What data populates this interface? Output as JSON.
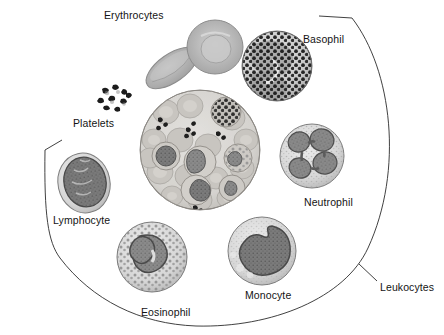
{
  "figure": {
    "background_color": "#ffffff",
    "line_color": "#2b2b2b",
    "style": "grayscale histology illustration"
  },
  "labels": [
    {
      "id": "erythrocytes",
      "text": "Erythrocytes",
      "x": 104,
      "y": 9
    },
    {
      "id": "basophil",
      "text": "Basophil",
      "x": 303,
      "y": 33
    },
    {
      "id": "platelets",
      "text": "Platelets",
      "x": 73,
      "y": 117
    },
    {
      "id": "neutrophil",
      "text": "Neutrophil",
      "x": 304,
      "y": 196
    },
    {
      "id": "lymphocyte",
      "text": "Lymphocyte",
      "x": 53,
      "y": 214
    },
    {
      "id": "eosinophil",
      "text": "Eosinophil",
      "x": 141,
      "y": 306
    },
    {
      "id": "monocyte",
      "text": "Monocyte",
      "x": 245,
      "y": 289
    },
    {
      "id": "leukocytes",
      "text": "Leukocytes",
      "x": 380,
      "y": 281
    }
  ],
  "cells": [
    {
      "id": "erythrocyte-face",
      "name": "Erythrocytes",
      "kind": "erythrocyte",
      "view": "face-on",
      "cx": 215,
      "cy": 47,
      "rx": 28,
      "ry": 27,
      "cytoplasm": "#b9b9b9",
      "nucleus": "none",
      "description": "Biconcave disc seen face-on with pale central pallor"
    },
    {
      "id": "erythrocyte-edge",
      "name": "Erythrocytes",
      "kind": "erythrocyte",
      "view": "edge-on",
      "cx": 172,
      "cy": 68,
      "rx": 30,
      "ry": 14,
      "rotate": -35,
      "cytoplasm": "#b4b4b4",
      "nucleus": "none",
      "description": "Biconcave disc seen edge-on, elongated oval"
    },
    {
      "id": "platelets",
      "name": "Platelets",
      "kind": "platelet-cluster",
      "cx": 113,
      "cy": 97,
      "rx": 17,
      "ry": 15,
      "cytoplasm": "#f2f2f2",
      "granule_color": "#202020",
      "count": 9,
      "description": "Small irregular dark cell fragments in a loose cluster"
    },
    {
      "id": "basophil",
      "name": "Basophil",
      "kind": "granulocyte",
      "cx": 277,
      "cy": 66,
      "rx": 36,
      "ry": 35,
      "cytoplasm": "#cfcfcf",
      "nucleus": "#9a9a9a",
      "granule_color": "#141414",
      "granule_density": "very high",
      "nucleus_lobes": 2,
      "description": "Round cell packed with coarse dark granules obscuring a bilobed nucleus"
    },
    {
      "id": "neutrophil",
      "name": "Neutrophil",
      "kind": "granulocyte",
      "cx": 312,
      "cy": 156,
      "rx": 33,
      "ry": 32,
      "cytoplasm": "#d8d8d8",
      "nucleus": "#8f8f8f",
      "granule_color": "#a8a8a8",
      "granule_density": "fine",
      "nucleus_lobes": 4,
      "description": "Pale cell with a multilobed (segmented) nucleus of four lobes joined by thin strands"
    },
    {
      "id": "lymphocyte",
      "name": "Lymphocyte",
      "kind": "agranulocyte",
      "cx": 84,
      "cy": 183,
      "rx": 26,
      "ry": 30,
      "cytoplasm": "#d5d5d5",
      "nucleus": "#7e7e7e",
      "nucleus_lobes": 1,
      "description": "Small cell almost entirely filled by a single large round dark nucleus with a thin cytoplasm rim"
    },
    {
      "id": "eosinophil",
      "name": "Eosinophil",
      "kind": "granulocyte",
      "cx": 152,
      "cy": 257,
      "rx": 35,
      "ry": 35,
      "cytoplasm": "#d2d2d2",
      "nucleus": "#8a8a8a",
      "granule_color": "#7a7a7a",
      "granule_density": "coarse",
      "nucleus_lobes": 2,
      "description": "Round cell with a bilobed nucleus and coarse speckled granules filling the cytoplasm"
    },
    {
      "id": "monocyte",
      "name": "Monocyte",
      "kind": "agranulocyte",
      "cx": 262,
      "cy": 251,
      "rx": 35,
      "ry": 34,
      "cytoplasm": "#dcdcdc",
      "nucleus": "#777777",
      "nucleus_lobes": 1,
      "description": "Large cell with an indented kidney- or horseshoe-shaped nucleus and abundant pale cytoplasm"
    },
    {
      "id": "blood-smear-field",
      "name": "Blood smear field",
      "kind": "field-of-view",
      "cx": 200,
      "cy": 150,
      "rx": 60,
      "ry": 60,
      "cytoplasm": "#d9d9d9",
      "description": "Central circular microscope field showing many erythrocytes with scattered leukocytes and platelet clumps"
    }
  ],
  "brackets": [
    {
      "id": "leukocytes-bracket",
      "label": "Leukocytes",
      "description": "Large arc sweeping from upper right, down the right side and around the bottom left, grouping the white blood cells",
      "leader": "short diagonal tick from the arc to the Leukocytes label"
    }
  ]
}
